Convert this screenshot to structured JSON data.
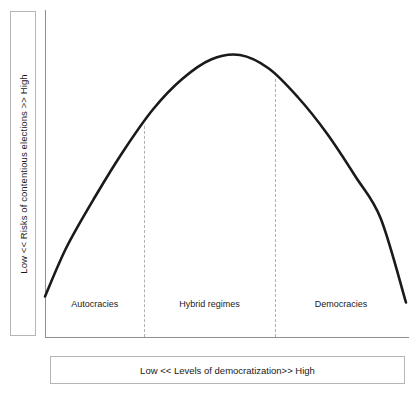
{
  "chart_data": {
    "type": "line",
    "title": "",
    "xlabel": "Low << Levels of democratization>> High",
    "ylabel": "Low << Risks of contentious elections >> High",
    "grid": false,
    "legend": null,
    "xlim": [
      0,
      1
    ],
    "ylim": [
      0,
      1
    ],
    "axis_tick_labels": {
      "x": [],
      "y": []
    },
    "categories": [
      "Autocracies",
      "Hybrid regimes",
      "Democracies"
    ],
    "category_boundaries": [
      0.275,
      0.638
    ],
    "series": [
      {
        "name": "Risk of contentious elections",
        "shape": "inverted-u",
        "x": [
          0.0,
          0.06,
          0.14,
          0.22,
          0.3,
          0.38,
          0.46,
          0.54,
          0.62,
          0.7,
          0.78,
          0.86,
          0.93,
          1.0
        ],
        "y": [
          0.135,
          0.3,
          0.47,
          0.625,
          0.76,
          0.86,
          0.925,
          0.94,
          0.895,
          0.8,
          0.68,
          0.535,
          0.395,
          0.115
        ],
        "peak": {
          "x": 0.465,
          "y": 0.94
        }
      }
    ],
    "annotations": [
      {
        "label": "Autocracies",
        "x": 0.138
      },
      {
        "label": "Hybrid regimes",
        "x": 0.456
      },
      {
        "label": "Democracies",
        "x": 0.82
      }
    ]
  },
  "axes": {
    "y_axis_color": "#8f8f8f",
    "x_axis_color": "#8f8f8f",
    "curve_color": "#1a1a1a",
    "divider_color": "#b0b0b0",
    "box_border_color": "#b5b5b5"
  },
  "labels": {
    "y_title": "Low << Risks of contentious elections >> High",
    "x_title": "Low << Levels of democratization>> High",
    "region_1": "Autocracies",
    "region_2": "Hybrid regimes",
    "region_3": "Democracies"
  }
}
